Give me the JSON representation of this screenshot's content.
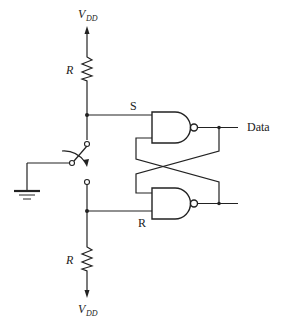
{
  "diagram": {
    "type": "switch-debouncer-sr-latch",
    "labels": {
      "vdd_top": "V",
      "vdd_top_sub": "DD",
      "vdd_bottom": "V",
      "vdd_bottom_sub": "DD",
      "r_top": "R",
      "r_bottom": "R",
      "s_input": "S",
      "r_input": "R",
      "output": "Data"
    },
    "components": [
      {
        "id": "vdd-top",
        "kind": "supply-arrow-up"
      },
      {
        "id": "resistor-top",
        "kind": "resistor",
        "label": "R"
      },
      {
        "id": "spdt-switch",
        "kind": "spdt-switch",
        "common": "ground"
      },
      {
        "id": "ground",
        "kind": "ground"
      },
      {
        "id": "resistor-bottom",
        "kind": "resistor",
        "label": "R"
      },
      {
        "id": "vdd-bottom",
        "kind": "supply-arrow-down"
      },
      {
        "id": "nand-top",
        "kind": "nand-gate",
        "input": "S",
        "output": "Data"
      },
      {
        "id": "nand-bottom",
        "kind": "nand-gate",
        "input": "R"
      }
    ],
    "colors": {
      "line": "#222222",
      "background": "#ffffff"
    }
  }
}
